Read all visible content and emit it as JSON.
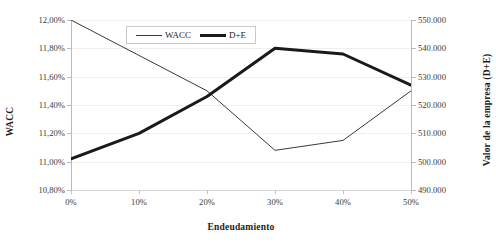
{
  "chart_data": {
    "type": "line",
    "title": "",
    "xlabel": "Endeudamiento",
    "ylabel": "WACC",
    "y2label": "Valor de la empresa (D+E)",
    "categories": [
      "0%",
      "10%",
      "20%",
      "30%",
      "40%",
      "50%"
    ],
    "x": [
      0,
      10,
      20,
      30,
      40,
      50
    ],
    "xlim": [
      0,
      50
    ],
    "ylim": [
      10.8,
      12.0
    ],
    "y2lim": [
      490000,
      550000
    ],
    "grid": true,
    "legend_position": "top-center",
    "x_tick_labels": [
      "0%",
      "10%",
      "20%",
      "30%",
      "40%",
      "50%"
    ],
    "y_tick_labels": [
      "12,00%",
      "11,80%",
      "11,60%",
      "11,40%",
      "11,20%",
      "11,00%",
      "10,80%"
    ],
    "y_tick_values": [
      12.0,
      11.8,
      11.6,
      11.4,
      11.2,
      11.0,
      10.8
    ],
    "y2_tick_labels": [
      "550.000",
      "540.000",
      "530.000",
      "520.000",
      "510.000",
      "500.000",
      "490.000"
    ],
    "y2_tick_values": [
      550000,
      540000,
      530000,
      520000,
      510000,
      500000,
      490000
    ],
    "series": [
      {
        "name": "WACC",
        "axis": "left",
        "color": "#3a3a3a",
        "line_width": 1,
        "values": [
          12.0,
          11.75,
          11.5,
          11.08,
          11.15,
          11.5
        ]
      },
      {
        "name": "D+E",
        "axis": "right",
        "color": "#1a1a1a",
        "line_width": 3,
        "values": [
          501000,
          510000,
          523000,
          540000,
          538000,
          527000
        ]
      }
    ]
  },
  "legend": {
    "items": [
      {
        "label": "WACC",
        "style": "thin"
      },
      {
        "label": "D+E",
        "style": "thick"
      }
    ]
  }
}
